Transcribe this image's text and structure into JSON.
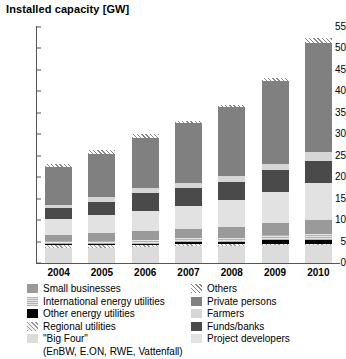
{
  "chart_data": {
    "type": "bar",
    "stacked": true,
    "title": "Installed capacity [GW]",
    "xlabel": "",
    "ylabel": "Installed capacity [GW]",
    "ylim": [
      0,
      55
    ],
    "ytick_step": 5,
    "yticks": [
      0,
      5,
      10,
      15,
      20,
      25,
      30,
      35,
      40,
      45,
      50,
      55
    ],
    "grid": false,
    "legend_position": "below",
    "categories": [
      "2004",
      "2005",
      "2006",
      "2007",
      "2008",
      "2009",
      "2010"
    ],
    "series": [
      {
        "name": "\"Big Four\"",
        "key": "bigfour",
        "values": [
          3.4,
          3.6,
          3.7,
          3.9,
          4.0,
          4.1,
          4.1
        ]
      },
      {
        "name": "Regional utilities",
        "key": "regional",
        "values": [
          0.7,
          0.5,
          0.5,
          0.5,
          0.4,
          0.4,
          0.4
        ]
      },
      {
        "name": "Other energy utilities",
        "key": "otherutil",
        "values": [
          0.3,
          0.3,
          0.3,
          0.4,
          0.4,
          0.8,
          0.9
        ]
      },
      {
        "name": "International energy utilities",
        "key": "intlutil",
        "values": [
          0.8,
          0.8,
          0.9,
          1.0,
          1.1,
          1.2,
          1.3
        ]
      },
      {
        "name": "Small businesses",
        "key": "smallbiz",
        "values": [
          1.4,
          1.7,
          2.0,
          2.1,
          2.4,
          2.9,
          3.4
        ]
      },
      {
        "name": "Project developers",
        "key": "projdev",
        "values": [
          3.6,
          4.2,
          4.8,
          5.3,
          6.3,
          7.2,
          8.5
        ]
      },
      {
        "name": "Funds/banks",
        "key": "funds",
        "values": [
          2.7,
          3.1,
          4.1,
          4.2,
          4.4,
          5.0,
          5.3
        ]
      },
      {
        "name": "Farmers",
        "key": "farmers",
        "values": [
          0.7,
          1.1,
          1.2,
          1.3,
          1.4,
          1.6,
          2.1
        ]
      },
      {
        "name": "Private persons",
        "key": "private",
        "values": [
          8.8,
          10.1,
          11.7,
          14.0,
          15.9,
          19.2,
          25.4
        ]
      },
      {
        "name": "Others",
        "key": "others",
        "values": [
          0.6,
          0.9,
          0.8,
          0.3,
          0.5,
          0.8,
          1.1
        ]
      }
    ],
    "totals": [
      23.0,
      26.3,
      30.0,
      33.0,
      36.8,
      43.2,
      52.5
    ]
  },
  "legend": {
    "left": [
      {
        "label": "Small businesses",
        "key": "smallbiz"
      },
      {
        "label": "International energy utilities",
        "key": "intlutil"
      },
      {
        "label": "Other energy utilities",
        "key": "otherutil"
      },
      {
        "label": "Regional utilities",
        "key": "regional"
      },
      {
        "label": "\"Big Four\"",
        "key": "bigfour"
      }
    ],
    "left_subnote": "(EnBW, E.ON, RWE, Vattenfall)",
    "right": [
      {
        "label": "Others",
        "key": "others"
      },
      {
        "label": "Private persons",
        "key": "private"
      },
      {
        "label": "Farmers",
        "key": "farmers"
      },
      {
        "label": "Funds/banks",
        "key": "funds"
      },
      {
        "label": "Project developers",
        "key": "projdev"
      }
    ]
  },
  "colors": {
    "bigfour": "#dcdcdc",
    "regional": "#e8e8e8",
    "otherutil": "#000000",
    "intlutil": "#c9c9c9",
    "smallbiz": "#9a9a9a",
    "projdev": "#e2e2e2",
    "funds": "#4a4a4a",
    "farmers": "#d6d6d6",
    "private": "#808080",
    "others": "#f0f0f0",
    "axis": "#555555",
    "text": "#000000"
  }
}
